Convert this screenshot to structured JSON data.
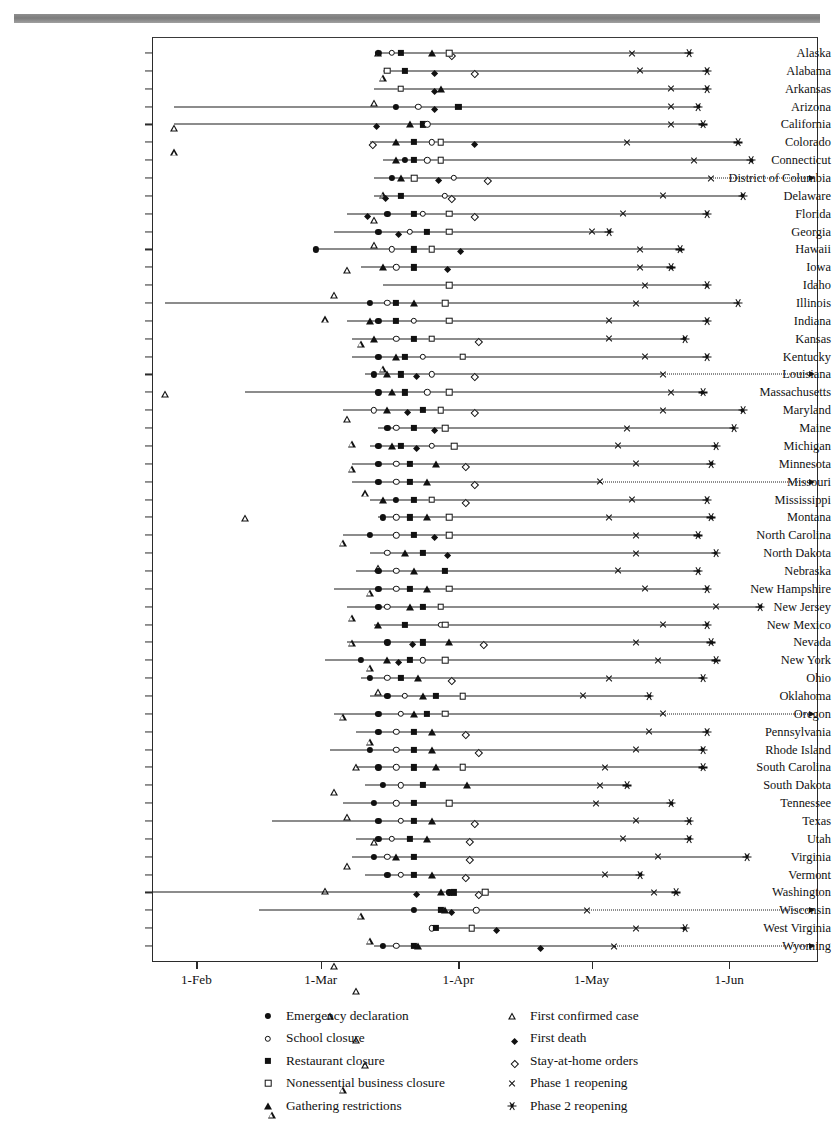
{
  "chart_data": {
    "type": "timeline",
    "title": "",
    "xlabel": "",
    "ylabel": "",
    "x_tick_labels": [
      "1-Feb",
      "1-Mar",
      "1-Apr",
      "1-May",
      "1-Jun"
    ],
    "x_tick_days": [
      31,
      59,
      90,
      120,
      151
    ],
    "x_range_days": [
      21,
      171
    ],
    "grid": false,
    "legend_position": "bottom",
    "event_types": [
      {
        "key": "emergency",
        "label": "Emergency declaration",
        "marker": "circle-filled"
      },
      {
        "key": "school",
        "label": "School closure",
        "marker": "circle-open"
      },
      {
        "key": "restaurant",
        "label": "Restaurant closure",
        "marker": "square-filled"
      },
      {
        "key": "nonessential",
        "label": "Nonessential business closure",
        "marker": "square-open"
      },
      {
        "key": "gathering",
        "label": "Gathering restrictions",
        "marker": "triangle-filled"
      },
      {
        "key": "firstcase",
        "label": "First confirmed case",
        "marker": "triangle-open"
      },
      {
        "key": "firstdeath",
        "label": "First death",
        "marker": "diamond-filled"
      },
      {
        "key": "stayathome",
        "label": "Stay-at-home orders",
        "marker": "diamond-open"
      },
      {
        "key": "phase1",
        "label": "Phase 1 reopening",
        "marker": "x-cross"
      },
      {
        "key": "phase2",
        "label": "Phase 2 reopening",
        "marker": "asterisk"
      }
    ],
    "legend_columns": [
      [
        "emergency",
        "school",
        "restaurant",
        "nonessential",
        "gathering"
      ],
      [
        "firstcase",
        "firstdeath",
        "stayathome",
        "phase1",
        "phase2"
      ]
    ],
    "rows": [
      {
        "state": "Alaska",
        "events": {
          "firstcase": 72,
          "emergency": 72,
          "school": 75,
          "restaurant": 77,
          "gathering": 84,
          "stayathome": 88,
          "nonessential": 88,
          "phase1": 129,
          "phase2": 142
        },
        "open_end": false
      },
      {
        "state": "Alabama",
        "events": {
          "firstcase": 73,
          "nonessential": 74,
          "restaurant": 78,
          "firstdeath": 84,
          "stayathome": 93,
          "phase1": 131,
          "phase2": 146
        },
        "open_end": false
      },
      {
        "state": "Arkansas",
        "events": {
          "firstcase": 71,
          "nonessential": 77,
          "firstdeath": 84,
          "gathering": 86,
          "phase1": 138,
          "phase2": 146
        },
        "open_end": false
      },
      {
        "state": "Arizona",
        "events": {
          "firstcase": 26,
          "emergency": 76,
          "school": 81,
          "firstdeath": 84,
          "restaurant": 90,
          "phase1": 138,
          "phase2": 144
        },
        "open_end": false
      },
      {
        "state": "California",
        "events": {
          "firstcase": 26,
          "firstdeath": 71,
          "gathering": 79,
          "restaurant": 82,
          "school": 83,
          "phase1": 138,
          "phase2": 145
        },
        "open_end": false
      },
      {
        "state": "Colorado",
        "events": {
          "stayathome": 70,
          "gathering": 76,
          "restaurant": 80,
          "school": 84,
          "nonessential": 86,
          "firstdeath": 93,
          "phase1": 128,
          "phase2": 153
        },
        "open_end": false
      },
      {
        "state": "Connecticut",
        "events": {
          "firstcase": 73,
          "gathering": 76,
          "emergency": 78,
          "restaurant": 80,
          "school": 83,
          "nonessential": 86,
          "phase1": 143,
          "phase2": 156
        },
        "open_end": false
      },
      {
        "state": "District of Columbia",
        "events": {
          "firstcase": 71,
          "emergency": 75,
          "gathering": 77,
          "nonessential": 80,
          "firstdeath": 85,
          "school": 89,
          "stayathome": 96,
          "phase1": 147
        },
        "open_end": true
      },
      {
        "state": "Delaware",
        "events": {
          "firstcase": 71,
          "firstdeath": 73,
          "restaurant": 77,
          "school": 87,
          "stayathome": 88,
          "phase1": 136,
          "phase2": 154
        },
        "open_end": false
      },
      {
        "state": "Florida",
        "events": {
          "firstcase": 65,
          "firstdeath": 69,
          "emergency": 74,
          "restaurant": 80,
          "school": 82,
          "nonessential": 88,
          "stayathome": 93,
          "phase1": 127,
          "phase2": 146
        },
        "open_end": false
      },
      {
        "state": "Georgia",
        "events": {
          "firstcase": 62,
          "emergency": 72,
          "firstdeath": 76,
          "school": 79,
          "restaurant": 83,
          "nonessential": 88,
          "phase1": 120,
          "phase2": 124
        },
        "open_end": false
      },
      {
        "state": "Hawaii",
        "events": {
          "emergency": 58,
          "firstcase": 60,
          "school": 75,
          "restaurant": 80,
          "nonessential": 84,
          "firstdeath": 90,
          "phase1": 131,
          "phase2": 140
        },
        "open_end": false
      },
      {
        "state": "Iowa",
        "events": {
          "firstcase": 68,
          "gathering": 73,
          "school": 76,
          "restaurant": 80,
          "firstdeath": 87,
          "phase1": 131,
          "phase2": 138
        },
        "open_end": false
      },
      {
        "state": "Idaho",
        "events": {
          "firstcase": 73,
          "nonessential": 88,
          "phase1": 132,
          "phase2": 146
        },
        "open_end": false
      },
      {
        "state": "Illinois",
        "events": {
          "firstcase": 24,
          "emergency": 70,
          "school": 74,
          "restaurant": 76,
          "gathering": 80,
          "nonessential": 87,
          "phase1": 130,
          "phase2": 153
        },
        "open_end": false
      },
      {
        "state": "Indiana",
        "events": {
          "firstcase": 65,
          "gathering": 70,
          "emergency": 72,
          "restaurant": 76,
          "school": 80,
          "nonessential": 88,
          "phase1": 124,
          "phase2": 146
        },
        "open_end": false
      },
      {
        "state": "Kansas",
        "events": {
          "firstcase": 66,
          "gathering": 71,
          "school": 76,
          "restaurant": 80,
          "nonessential": 84,
          "stayathome": 94,
          "phase1": 124,
          "phase2": 141
        },
        "open_end": false
      },
      {
        "state": "Kentucky",
        "events": {
          "firstcase": 66,
          "emergency": 72,
          "gathering": 76,
          "restaurant": 78,
          "school": 82,
          "nonessential": 91,
          "phase1": 132,
          "phase2": 146
        },
        "open_end": false
      },
      {
        "state": "Louisiana",
        "events": {
          "firstcase": 69,
          "emergency": 71,
          "gathering": 74,
          "restaurant": 77,
          "firstdeath": 80,
          "school": 84,
          "stayathome": 93,
          "phase1": 136
        },
        "open_end": true
      },
      {
        "state": "Massachusetts",
        "events": {
          "firstcase": 42,
          "emergency": 72,
          "gathering": 75,
          "restaurant": 78,
          "school": 83,
          "nonessential": 88,
          "phase1": 138,
          "phase2": 145
        },
        "open_end": false
      },
      {
        "state": "Maryland",
        "events": {
          "firstcase": 64,
          "school": 71,
          "gathering": 74,
          "firstdeath": 78,
          "restaurant": 82,
          "nonessential": 86,
          "stayathome": 93,
          "phase1": 136,
          "phase2": 154
        },
        "open_end": false
      },
      {
        "state": "Maine",
        "events": {
          "firstcase": 72,
          "emergency": 74,
          "school": 76,
          "restaurant": 80,
          "firstdeath": 84,
          "nonessential": 87,
          "phase1": 128,
          "phase2": 152
        },
        "open_end": false
      },
      {
        "state": "Michigan",
        "events": {
          "firstcase": 70,
          "emergency": 72,
          "gathering": 75,
          "restaurant": 77,
          "firstdeath": 80,
          "school": 84,
          "nonessential": 89,
          "phase1": 126,
          "phase2": 148
        },
        "open_end": false
      },
      {
        "state": "Minnesota",
        "events": {
          "firstcase": 66,
          "emergency": 72,
          "school": 76,
          "restaurant": 79,
          "gathering": 85,
          "stayathome": 91,
          "phase1": 130,
          "phase2": 147
        },
        "open_end": false
      },
      {
        "state": "Missouri",
        "events": {
          "firstcase": 66,
          "emergency": 72,
          "school": 76,
          "restaurant": 79,
          "gathering": 83,
          "stayathome": 93,
          "phase1": 122
        },
        "open_end": true
      },
      {
        "state": "Mississippi",
        "events": {
          "firstcase": 70,
          "gathering": 73,
          "emergency": 76,
          "restaurant": 80,
          "nonessential": 84,
          "stayathome": 91,
          "phase1": 129,
          "phase2": 146
        },
        "open_end": false
      },
      {
        "state": "Montana",
        "events": {
          "firstcase": 72,
          "emergency": 73,
          "school": 76,
          "restaurant": 79,
          "gathering": 83,
          "nonessential": 88,
          "phase1": 124,
          "phase2": 147
        },
        "open_end": false
      },
      {
        "state": "North Carolina",
        "events": {
          "firstcase": 64,
          "emergency": 70,
          "school": 76,
          "restaurant": 80,
          "firstdeath": 84,
          "nonessential": 88,
          "phase1": 130,
          "phase2": 144
        },
        "open_end": false
      },
      {
        "state": "North Dakota",
        "events": {
          "firstcase": 70,
          "school": 74,
          "gathering": 78,
          "restaurant": 82,
          "firstdeath": 87,
          "phase1": 130,
          "phase2": 148
        },
        "open_end": false
      },
      {
        "state": "Nebraska",
        "events": {
          "firstcase": 67,
          "emergency": 72,
          "school": 76,
          "gathering": 80,
          "restaurant": 87,
          "phase1": 126,
          "phase2": 144
        },
        "open_end": false
      },
      {
        "state": "New Hampshire",
        "events": {
          "firstcase": 62,
          "emergency": 72,
          "school": 76,
          "restaurant": 79,
          "gathering": 83,
          "nonessential": 88,
          "phase1": 132,
          "phase2": 146
        },
        "open_end": false
      },
      {
        "state": "New Jersey",
        "events": {
          "firstcase": 65,
          "emergency": 72,
          "school": 74,
          "gathering": 79,
          "restaurant": 82,
          "nonessential": 86,
          "phase1": 148,
          "phase2": 158
        },
        "open_end": false
      },
      {
        "state": "New Jersey2",
        "events": {},
        "skip": true
      },
      {
        "state": "New Mexico",
        "events": {
          "firstcase": 71,
          "gathering": 72,
          "restaurant": 78,
          "school": 86,
          "nonessential": 87,
          "phase1": 136,
          "phase2": 146
        },
        "open_end": false
      },
      {
        "state": "Nevada",
        "events": {
          "firstcase": 65,
          "emergency": 74,
          "firstdeath": 79,
          "restaurant": 82,
          "gathering": 88,
          "stayathome": 95,
          "phase1": 130,
          "phase2": 147
        },
        "open_end": false
      },
      {
        "state": "New York",
        "events": {
          "firstcase": 60,
          "emergency": 68,
          "gathering": 74,
          "firstdeath": 76,
          "restaurant": 79,
          "school": 82,
          "nonessential": 87,
          "phase1": 135,
          "phase2": 148
        },
        "open_end": false
      },
      {
        "state": "Ohio",
        "events": {
          "firstcase": 68,
          "emergency": 70,
          "school": 74,
          "restaurant": 77,
          "gathering": 81,
          "stayathome": 88,
          "phase1": 124,
          "phase2": 145
        },
        "open_end": false
      },
      {
        "state": "Oklahoma",
        "events": {
          "firstcase": 70,
          "emergency": 74,
          "school": 78,
          "gathering": 82,
          "restaurant": 85,
          "nonessential": 91,
          "phase1": 118,
          "phase2": 133
        },
        "open_end": false
      },
      {
        "state": "Oregon",
        "events": {
          "firstcase": 62,
          "emergency": 72,
          "school": 77,
          "gathering": 80,
          "restaurant": 83,
          "nonessential": 87,
          "phase1": 136
        },
        "open_end": true
      },
      {
        "state": "Pennsylvania",
        "events": {
          "firstcase": 67,
          "emergency": 72,
          "school": 76,
          "restaurant": 80,
          "gathering": 84,
          "stayathome": 91,
          "phase1": 133,
          "phase2": 146
        },
        "open_end": false
      },
      {
        "state": "Rhode Island",
        "events": {
          "firstcase": 61,
          "emergency": 70,
          "school": 76,
          "restaurant": 80,
          "gathering": 84,
          "stayathome": 94,
          "phase1": 130,
          "phase2": 145
        },
        "open_end": false
      },
      {
        "state": "South Carolina",
        "events": {
          "firstcase": 67,
          "emergency": 72,
          "school": 76,
          "restaurant": 80,
          "gathering": 85,
          "nonessential": 91,
          "phase1": 123,
          "phase2": 145
        },
        "open_end": false
      },
      {
        "state": "South Dakota",
        "events": {
          "firstcase": 69,
          "emergency": 73,
          "school": 77,
          "restaurant": 82,
          "gathering": 92,
          "phase1": 122,
          "phase2": 128
        },
        "open_end": false
      },
      {
        "state": "Tennessee",
        "events": {
          "firstcase": 64,
          "emergency": 71,
          "school": 76,
          "restaurant": 80,
          "nonessential": 88,
          "phase1": 121,
          "phase2": 138
        },
        "open_end": false
      },
      {
        "state": "Texas",
        "events": {
          "firstcase": 48,
          "emergency": 72,
          "school": 77,
          "restaurant": 80,
          "gathering": 84,
          "stayathome": 93,
          "phase1": 130,
          "phase2": 142
        },
        "open_end": false
      },
      {
        "state": "Utah",
        "events": {
          "firstcase": 67,
          "emergency": 72,
          "school": 75,
          "restaurant": 79,
          "gathering": 83,
          "stayathome": 92,
          "phase1": 127,
          "phase2": 142
        },
        "open_end": false
      },
      {
        "state": "Virginia",
        "events": {
          "firstcase": 66,
          "emergency": 71,
          "school": 74,
          "gathering": 76,
          "restaurant": 80,
          "stayathome": 92,
          "phase1": 135,
          "phase2": 155
        },
        "open_end": false
      },
      {
        "state": "Vermont",
        "events": {
          "firstcase": 69,
          "emergency": 74,
          "school": 77,
          "restaurant": 80,
          "gathering": 84,
          "stayathome": 91,
          "phase1": 123,
          "phase2": 131
        },
        "open_end": false
      },
      {
        "state": "Washington",
        "events": {
          "firstcase": 21,
          "firstdeath": 80,
          "gathering": 86,
          "emergency": 88,
          "restaurant": 89,
          "stayathome": 94,
          "nonessential": 96,
          "phase1": 134,
          "phase2": 139
        },
        "open_end": false
      },
      {
        "state": "Wisconsin",
        "events": {
          "firstcase": 45,
          "emergency": 80,
          "restaurant": 86,
          "gathering": 87,
          "firstdeath": 88,
          "school": 94,
          "phase1": 119
        },
        "open_end": true
      },
      {
        "state": "West Virginia",
        "events": {
          "school": 84,
          "restaurant": 85,
          "nonessential": 93,
          "firstdeath": 98,
          "phase1": 130,
          "phase2": 141
        },
        "open_end": false
      },
      {
        "state": "Wyoming",
        "events": {
          "firstcase": 71,
          "emergency": 73,
          "school": 76,
          "restaurant": 80,
          "gathering": 81,
          "firstdeath": 108,
          "phase1": 125
        },
        "open_end": true
      }
    ]
  }
}
